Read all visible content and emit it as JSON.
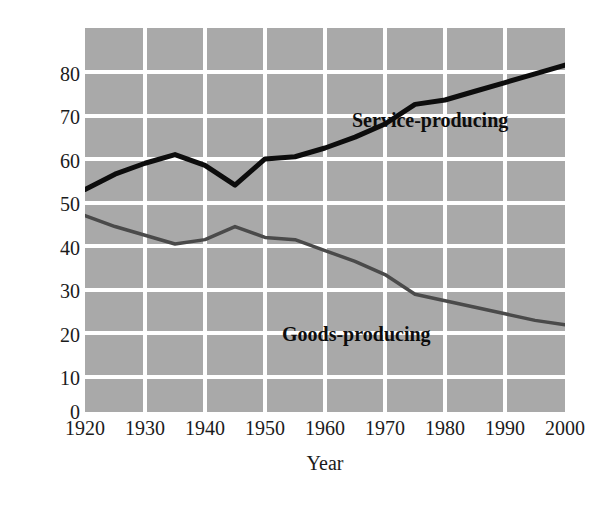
{
  "chart_data": {
    "type": "line",
    "title": "",
    "subtitle": "",
    "xlabel": "Year",
    "ylabel": "Percent",
    "x": [
      1920,
      1925,
      1930,
      1935,
      1940,
      1945,
      1950,
      1955,
      1960,
      1965,
      1970,
      1975,
      1980,
      1985,
      1990,
      1995,
      2000
    ],
    "xlim": [
      1920,
      2000
    ],
    "ylim": [
      0,
      88
    ],
    "xticks": [
      1920,
      1930,
      1940,
      1950,
      1960,
      1970,
      1980,
      1990,
      2000
    ],
    "yticks": [
      0,
      10,
      20,
      30,
      40,
      50,
      60,
      70,
      80
    ],
    "xtick_labels": [
      "1920",
      "1930",
      "1940",
      "1950",
      "1960",
      "1970",
      "1980",
      "1990",
      "2000"
    ],
    "ytick_labels": [
      "0",
      "10",
      "20",
      "30",
      "40",
      "50",
      "60",
      "70",
      "80"
    ],
    "grid": true,
    "grid_color": "#ffffff",
    "plot_background": "#a9a9a9",
    "legend_position": "inline-annotations",
    "series": [
      {
        "name": "Service-producing",
        "color": "#0d0d0d",
        "line_width": 5,
        "values": [
          51,
          54.5,
          57,
          59,
          56.5,
          52,
          58,
          58.5,
          60.5,
          63,
          66,
          70.5,
          71.5,
          73.5,
          75.5,
          77.5,
          79.5
        ]
      },
      {
        "name": "Goods-producing",
        "color": "#4a4a4a",
        "line_width": 3.5,
        "values": [
          45,
          42.5,
          40.5,
          38.5,
          39.5,
          42.5,
          40,
          39.5,
          37,
          34.5,
          31.5,
          27,
          25.5,
          24,
          22.5,
          21,
          20
        ]
      }
    ],
    "annotations": [
      {
        "text": "Service-producing",
        "x": 1965,
        "y": 72
      },
      {
        "text": "Goods-producing",
        "x": 1942,
        "y": 28
      }
    ]
  },
  "axes": {
    "y_title": "Percent",
    "x_title": "Year"
  }
}
